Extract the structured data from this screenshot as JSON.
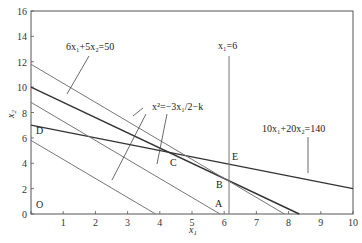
{
  "chart_data": {
    "type": "line",
    "title": "",
    "xlabel": "x1",
    "ylabel": "x2",
    "xlim": [
      0,
      10
    ],
    "ylim": [
      0,
      16
    ],
    "grid": false,
    "x_ticks": [
      0,
      1,
      2,
      3,
      4,
      5,
      6,
      7,
      8,
      9,
      10
    ],
    "x_tick_labels": [
      "",
      "1",
      "2",
      "3",
      "4",
      "5",
      "6",
      "7",
      "8",
      "9",
      "10"
    ],
    "y_ticks": [
      0,
      2,
      4,
      6,
      8,
      10,
      12,
      14,
      16
    ],
    "y_tick_labels": [
      "0",
      "2",
      "4",
      "6",
      "8",
      "10",
      "12",
      "14",
      "16"
    ],
    "series": [
      {
        "name": "6x1+5x2=50",
        "style": "dark",
        "points": [
          [
            0,
            10
          ],
          [
            8.33,
            0
          ]
        ]
      },
      {
        "name": "10x1+20x2=140",
        "style": "dark",
        "points": [
          [
            0,
            7
          ],
          [
            10,
            2
          ]
        ]
      },
      {
        "name": "x1=6",
        "style": "gray",
        "points": [
          [
            6,
            0
          ],
          [
            6,
            12.5
          ]
        ]
      },
      {
        "name": "x2=-3x1/2-k (level 1)",
        "style": "gray",
        "points": [
          [
            0,
            5.8
          ],
          [
            3.87,
            0
          ]
        ]
      },
      {
        "name": "x2=-3x1/2-k (level 2)",
        "style": "gray",
        "points": [
          [
            0,
            8.8
          ],
          [
            5.87,
            0
          ]
        ]
      },
      {
        "name": "x2=-3x1/2-k (level 3)",
        "style": "gray",
        "points": [
          [
            0,
            11.8
          ],
          [
            7.87,
            0
          ]
        ]
      }
    ],
    "annotations": [
      {
        "text": "6x1+5x2=50",
        "x": 1.1,
        "y": 13.3
      },
      {
        "text": "x1=6",
        "x": 5.85,
        "y": 13.4
      },
      {
        "text": "x2=-3x1/2-k",
        "x": 4.2,
        "y": 7.7
      },
      {
        "text": "10x1+20x2=140",
        "x": 8.1,
        "y": 6.2
      }
    ],
    "points": [
      {
        "label": "O",
        "x": 0.2,
        "y": 0.8
      },
      {
        "label": "D",
        "x": 0.15,
        "y": 6.7
      },
      {
        "label": "C",
        "x": 4.3,
        "y": 3.9
      },
      {
        "label": "E",
        "x": 6.3,
        "y": 4.9
      },
      {
        "label": "B",
        "x": 5.6,
        "y": 2.2
      },
      {
        "label": "A",
        "x": 5.7,
        "y": 0.8
      }
    ]
  },
  "labels": {
    "xlabel_main": "x",
    "xlabel_sub": "1",
    "ylabel_main": "x",
    "ylabel_sub": "2",
    "eq1": "6x₁+5x₂=50",
    "eq2": "x₁=6",
    "eq3": "x²=−3x₁/2−k",
    "eq4": "10x₁+20x₂=140",
    "pt_O": "O",
    "pt_D": "D",
    "pt_C": "C",
    "pt_E": "E",
    "pt_B": "B",
    "pt_A": "A"
  },
  "colors": {
    "dark_line": "#333333",
    "gray_line": "#777777",
    "axis": "#555555"
  }
}
